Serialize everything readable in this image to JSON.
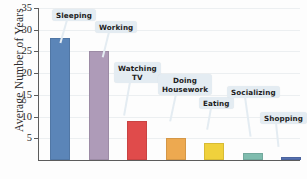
{
  "chart_data": {
    "type": "bar",
    "title": "",
    "xlabel": "",
    "ylabel": "Average Number of Years",
    "ylim": [
      0,
      35
    ],
    "grid": true,
    "legend": "none",
    "yticks": [
      5,
      10,
      15,
      20,
      25,
      30,
      35
    ],
    "categories": [
      "Sleeping",
      "Working",
      "Watching TV",
      "Doing Housework",
      "Eating",
      "Socializing",
      "Shopping"
    ],
    "values": [
      28,
      25,
      9,
      5,
      4,
      1.7,
      0.7
    ],
    "bar_colors": [
      "#5b85b8",
      "#ae9bb8",
      "#e04b4b",
      "#eda950",
      "#f0d13c",
      "#7fbcae",
      "#5570b0"
    ]
  },
  "axis": {
    "y_title": "Average Number of Years",
    "tick_labels": [
      "5",
      "10",
      "15",
      "20",
      "25",
      "30",
      "35"
    ]
  },
  "callouts": [
    {
      "label": "Sleeping"
    },
    {
      "label": "Working"
    },
    {
      "label": "Watching\nTV"
    },
    {
      "label": "Doing\nHousework"
    },
    {
      "label": "Eating"
    },
    {
      "label": "Socializing"
    },
    {
      "label": "Shopping"
    }
  ]
}
